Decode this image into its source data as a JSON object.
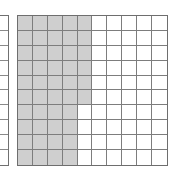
{
  "colors": {
    "shaded_fill": "#cfcfcf",
    "unshaded_fill": "#ffffff",
    "inner_gridline": "#7d7d7d",
    "outer_border": "#6e6e6e",
    "page_background": "#ffffff"
  },
  "chart_data": {
    "type": "heatmap",
    "title": "",
    "xlabel": "",
    "ylabel": "",
    "rows": 10,
    "columns": 10,
    "total_cells": 100,
    "shaded_cells": 46,
    "unshaded_cells": 54,
    "fraction_shaded": "46/100",
    "decimal_shaded": 0.46,
    "percent_shaded": 46,
    "legend": [
      {
        "label": "Shaded",
        "color": "#cfcfcf",
        "count": 46
      },
      {
        "label": "Unshaded",
        "color": "#ffffff",
        "count": 54
      }
    ],
    "shaded_columns_per_row": [
      5,
      5,
      5,
      5,
      5,
      5,
      4,
      4,
      4,
      4
    ],
    "grid": [
      [
        1,
        1,
        1,
        1,
        1,
        0,
        0,
        0,
        0,
        0
      ],
      [
        1,
        1,
        1,
        1,
        1,
        0,
        0,
        0,
        0,
        0
      ],
      [
        1,
        1,
        1,
        1,
        1,
        0,
        0,
        0,
        0,
        0
      ],
      [
        1,
        1,
        1,
        1,
        1,
        0,
        0,
        0,
        0,
        0
      ],
      [
        1,
        1,
        1,
        1,
        1,
        0,
        0,
        0,
        0,
        0
      ],
      [
        1,
        1,
        1,
        1,
        1,
        0,
        0,
        0,
        0,
        0
      ],
      [
        1,
        1,
        1,
        1,
        0,
        0,
        0,
        0,
        0,
        0
      ],
      [
        1,
        1,
        1,
        1,
        0,
        0,
        0,
        0,
        0,
        0
      ],
      [
        1,
        1,
        1,
        1,
        0,
        0,
        0,
        0,
        0,
        0
      ],
      [
        1,
        1,
        1,
        1,
        0,
        0,
        0,
        0,
        0,
        0
      ]
    ]
  },
  "partial_grid": {
    "rows": 10,
    "columns": 10,
    "shaded_cells": 0,
    "note": "clipped at the left page edge; only the rightmost sliver is visible",
    "grid": [
      [
        0,
        0,
        0,
        0,
        0,
        0,
        0,
        0,
        0,
        0
      ],
      [
        0,
        0,
        0,
        0,
        0,
        0,
        0,
        0,
        0,
        0
      ],
      [
        0,
        0,
        0,
        0,
        0,
        0,
        0,
        0,
        0,
        0
      ],
      [
        0,
        0,
        0,
        0,
        0,
        0,
        0,
        0,
        0,
        0
      ],
      [
        0,
        0,
        0,
        0,
        0,
        0,
        0,
        0,
        0,
        0
      ],
      [
        0,
        0,
        0,
        0,
        0,
        0,
        0,
        0,
        0,
        0
      ],
      [
        0,
        0,
        0,
        0,
        0,
        0,
        0,
        0,
        0,
        0
      ],
      [
        0,
        0,
        0,
        0,
        0,
        0,
        0,
        0,
        0,
        0
      ],
      [
        0,
        0,
        0,
        0,
        0,
        0,
        0,
        0,
        0,
        0
      ],
      [
        0,
        0,
        0,
        0,
        0,
        0,
        0,
        0,
        0,
        0
      ]
    ]
  }
}
